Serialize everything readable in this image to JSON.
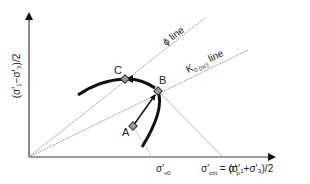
{
  "diagram": {
    "y_axis_label": "(σ'₁−σ'₃)/2",
    "x_axis_label": "(σ'₁+σ'₃)/2",
    "lines": [
      {
        "name": "phi-line",
        "label": "ϕ line"
      },
      {
        "name": "k0-line",
        "label_main": "K",
        "label_sub": "0 (nc)",
        "label_tail": " line"
      }
    ],
    "points": [
      {
        "id": "A",
        "label": "A"
      },
      {
        "id": "B",
        "label": "B"
      },
      {
        "id": "C",
        "label": "C"
      }
    ],
    "x_ticks": [
      {
        "label_main": "σ'",
        "label_sub": "v0"
      },
      {
        "label_main": "σ'",
        "label_sub": "crit",
        "eq": " = σ'",
        "eq_sub": "p"
      }
    ],
    "colors": {
      "axis": "#3a3a3a",
      "curve": "#111111",
      "guide": "#bbbbbb",
      "dotted": "#777777",
      "marker": "#888888"
    }
  }
}
